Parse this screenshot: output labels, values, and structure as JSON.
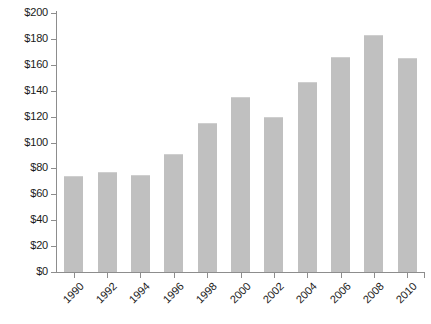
{
  "chart_data": {
    "type": "bar",
    "title": "",
    "subtitle": "",
    "xlabel": "",
    "ylabel": "",
    "categories": [
      "1990",
      "1992",
      "1994",
      "1996",
      "1998",
      "2000",
      "2002",
      "2004",
      "2006",
      "2008",
      "2010"
    ],
    "values": [
      74,
      77,
      75,
      91,
      115,
      135,
      120,
      147,
      166,
      183,
      165
    ],
    "value_prefix": "$",
    "ylim": [
      0,
      200
    ],
    "ytick_step": 20,
    "ytick_labels": [
      "$0",
      "$20",
      "$40",
      "$60",
      "$80",
      "$100",
      "$120",
      "$140",
      "$160",
      "$180",
      "$200"
    ],
    "ytick_values": [
      0,
      20,
      40,
      60,
      80,
      100,
      120,
      140,
      160,
      180,
      200
    ],
    "grid": false,
    "legend": null,
    "legend_position": "none",
    "bar_color": "#c0c0c0",
    "axis_color": "#8d8d8d",
    "background_color": "#ffffff",
    "xlabel_rotation": -45,
    "annotations": []
  }
}
